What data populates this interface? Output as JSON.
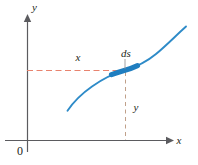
{
  "figure": {
    "background_color": "#ffffff",
    "width": 198,
    "height": 165
  },
  "axes": {
    "x_axis": {
      "label": "x",
      "color": "#5b5b5f",
      "arrow": "right-arrow-icon",
      "start_px": [
        5,
        140
      ],
      "end_px": [
        170,
        140
      ]
    },
    "y_axis": {
      "label": "y",
      "color": "#5b5b5f",
      "arrow": "up-arrow-icon",
      "start_px": [
        27,
        140
      ],
      "end_px": [
        27,
        18
      ]
    },
    "origin": {
      "label": "0",
      "position_px": [
        20,
        152
      ]
    }
  },
  "curve": {
    "name": "function-curve",
    "color": "#2e8bc8",
    "stroke_width": 1.9,
    "description": "increasing S-shaped curve",
    "start_px": [
      67,
      111
    ],
    "end_px": [
      186,
      27
    ]
  },
  "segment": {
    "name": "ds-segment",
    "label": "ds",
    "color": "#1f7ec0",
    "stroke_width": 5,
    "label_position_px": [
      119,
      57
    ],
    "start_px": [
      111,
      76
    ],
    "end_px": [
      138,
      64
    ]
  },
  "guides": {
    "horizontal": {
      "name": "x-guide-line",
      "label": "x",
      "color": "#e8836e",
      "y_px": 70,
      "x_start_px": 27,
      "x_end_px": 127,
      "label_position_px": [
        76,
        58
      ]
    },
    "vertical": {
      "name": "y-guide-line",
      "label": "y",
      "color": "#c0a08a",
      "x_px": 125,
      "y_start_px": 72,
      "y_end_px": 140,
      "label_position_px": [
        133,
        108
      ]
    }
  },
  "colors": {
    "axis": "#5b5b5f",
    "curve": "#2e8bc8",
    "segment": "#1f7ec0",
    "guide_horizontal": "#e8836e",
    "guide_vertical": "#c0a08a",
    "text": "#231f20",
    "background": "#ffffff"
  }
}
